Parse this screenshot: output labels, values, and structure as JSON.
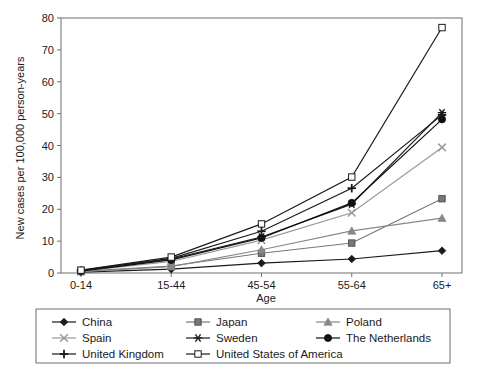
{
  "chart_data": {
    "type": "line",
    "title": "",
    "xlabel": "Age",
    "ylabel": "New cases per 100,000 person-years",
    "categories": [
      "0-14",
      "15-44",
      "45-54",
      "55-64",
      "65+"
    ],
    "ylim": [
      0,
      80
    ],
    "yticks": [
      0,
      10,
      20,
      30,
      40,
      50,
      60,
      70,
      80
    ],
    "grid": false,
    "legend_position": "below-plot",
    "series": [
      {
        "name": "China",
        "marker": "filled-diamond",
        "color": "#1a1a1a",
        "values": [
          0.3,
          1.2,
          3.1,
          4.4,
          7.0
        ]
      },
      {
        "name": "Japan",
        "marker": "filled-square",
        "color": "#777777",
        "values": [
          0.5,
          2.2,
          6.2,
          9.4,
          23.3
        ]
      },
      {
        "name": "Poland",
        "marker": "filled-triangle",
        "color": "#888888",
        "values": [
          0.4,
          2.0,
          7.3,
          13.2,
          17.2
        ]
      },
      {
        "name": "Spain",
        "marker": "cross-x",
        "color": "#999999",
        "values": [
          0.6,
          3.6,
          10.3,
          18.9,
          39.4
        ]
      },
      {
        "name": "Sweden",
        "marker": "asterisk",
        "color": "#1a1a1a",
        "values": [
          0.7,
          4.4,
          11.3,
          21.6,
          50.3
        ]
      },
      {
        "name": "The Netherlands",
        "marker": "filled-circle",
        "color": "#111111",
        "values": [
          0.6,
          4.1,
          11.0,
          22.0,
          48.2
        ]
      },
      {
        "name": "United Kingdom",
        "marker": "plus",
        "color": "#1a1a1a",
        "values": [
          0.8,
          4.6,
          13.1,
          26.6,
          49.6
        ]
      },
      {
        "name": "United States of America",
        "marker": "open-square",
        "color": "#1a1a1a",
        "values": [
          0.9,
          5.0,
          15.4,
          30.1,
          77.0
        ]
      }
    ]
  },
  "legend": {
    "rows": [
      [
        "China",
        "Japan",
        "Poland"
      ],
      [
        "Spain",
        "Sweden",
        "The Netherlands"
      ],
      [
        "United Kingdom",
        "United States of America",
        ""
      ]
    ]
  }
}
